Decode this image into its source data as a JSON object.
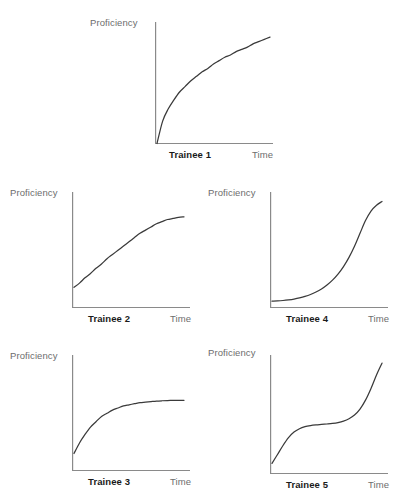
{
  "figure": {
    "background_color": "#ffffff",
    "axis_color": "#8a8a8a",
    "curve_color": "#3a3a3a",
    "label_color": "#6d6d6d",
    "trainee_label_color": "#1a1a1a"
  },
  "chart_data": [
    {
      "type": "line",
      "title": "Trainee 1",
      "xlabel": "Time",
      "ylabel": "Proficiency",
      "grid": false,
      "legend": "none",
      "xlim": [
        0,
        1
      ],
      "ylim": [
        0,
        1
      ],
      "shape": "negatively accelerated / decelerating learning curve",
      "x": [
        0.0,
        0.05,
        0.1,
        0.15,
        0.2,
        0.25,
        0.3,
        0.35,
        0.4,
        0.45,
        0.5,
        0.55,
        0.6,
        0.65,
        0.7,
        0.75,
        0.8,
        0.85,
        0.9,
        0.95,
        1.0
      ],
      "y": [
        0.0,
        0.2,
        0.31,
        0.39,
        0.46,
        0.51,
        0.56,
        0.6,
        0.64,
        0.67,
        0.71,
        0.74,
        0.77,
        0.79,
        0.82,
        0.84,
        0.86,
        0.89,
        0.91,
        0.93,
        0.95
      ]
    },
    {
      "type": "line",
      "title": "Trainee 2",
      "xlabel": "Time",
      "ylabel": "Proficiency",
      "grid": false,
      "legend": "none",
      "xlim": [
        0,
        1
      ],
      "ylim": [
        0,
        1
      ],
      "shape": "gradual rise, slightly decelerating near the end",
      "x": [
        0.0,
        0.05,
        0.1,
        0.15,
        0.2,
        0.25,
        0.3,
        0.35,
        0.4,
        0.45,
        0.5,
        0.55,
        0.6,
        0.65,
        0.7,
        0.75,
        0.8,
        0.85,
        0.9,
        0.95,
        1.0
      ],
      "y": [
        0.19,
        0.23,
        0.28,
        0.32,
        0.37,
        0.41,
        0.46,
        0.5,
        0.54,
        0.58,
        0.62,
        0.66,
        0.7,
        0.73,
        0.76,
        0.79,
        0.81,
        0.83,
        0.84,
        0.85,
        0.855
      ]
    },
    {
      "type": "line",
      "title": "Trainee 3",
      "xlabel": "Time",
      "ylabel": "Proficiency",
      "grid": false,
      "legend": "none",
      "xlim": [
        0,
        1
      ],
      "ylim": [
        0,
        1
      ],
      "shape": "rapid early gain then plateau / asymptote",
      "x": [
        0.0,
        0.05,
        0.1,
        0.15,
        0.2,
        0.25,
        0.3,
        0.35,
        0.4,
        0.45,
        0.5,
        0.55,
        0.6,
        0.65,
        0.7,
        0.75,
        0.8,
        0.85,
        0.9,
        0.95,
        1.0
      ],
      "y": [
        0.16,
        0.26,
        0.34,
        0.41,
        0.46,
        0.51,
        0.54,
        0.57,
        0.59,
        0.61,
        0.62,
        0.63,
        0.64,
        0.645,
        0.65,
        0.655,
        0.658,
        0.66,
        0.661,
        0.662,
        0.662
      ]
    },
    {
      "type": "line",
      "title": "Trainee 4",
      "xlabel": "Time",
      "ylabel": "Proficiency",
      "grid": false,
      "legend": "none",
      "xlim": [
        0,
        1
      ],
      "ylim": [
        0,
        1
      ],
      "shape": "positively accelerated / exponential learning curve",
      "x": [
        0.0,
        0.05,
        0.1,
        0.15,
        0.2,
        0.25,
        0.3,
        0.35,
        0.4,
        0.45,
        0.5,
        0.55,
        0.6,
        0.65,
        0.7,
        0.75,
        0.8,
        0.85,
        0.9,
        0.95,
        1.0
      ],
      "y": [
        0.06,
        0.062,
        0.066,
        0.072,
        0.08,
        0.091,
        0.105,
        0.123,
        0.146,
        0.175,
        0.212,
        0.258,
        0.315,
        0.386,
        0.473,
        0.578,
        0.7,
        0.82,
        0.91,
        0.965,
        1.0
      ]
    },
    {
      "type": "line",
      "title": "Trainee 5",
      "xlabel": "Time",
      "ylabel": "Proficiency",
      "grid": false,
      "legend": "none",
      "xlim": [
        0,
        1
      ],
      "ylim": [
        0,
        1
      ],
      "shape": "S-shaped: early gain, long plateau, then sharp late rise",
      "x": [
        0.0,
        0.05,
        0.1,
        0.15,
        0.2,
        0.25,
        0.3,
        0.35,
        0.4,
        0.45,
        0.5,
        0.55,
        0.6,
        0.65,
        0.7,
        0.75,
        0.8,
        0.85,
        0.9,
        0.95,
        1.0
      ],
      "y": [
        0.09,
        0.17,
        0.25,
        0.32,
        0.37,
        0.4,
        0.418,
        0.428,
        0.434,
        0.438,
        0.442,
        0.447,
        0.455,
        0.468,
        0.489,
        0.522,
        0.575,
        0.655,
        0.76,
        0.88,
        0.985
      ]
    }
  ],
  "panels": [
    {
      "id": "trainee-1",
      "trainee_label": "Trainee 1",
      "y_axis_label": "Proficiency",
      "x_axis_label": "Time"
    },
    {
      "id": "trainee-2",
      "trainee_label": "Trainee 2",
      "y_axis_label": "Proficiency",
      "x_axis_label": "Time"
    },
    {
      "id": "trainee-4",
      "trainee_label": "Trainee 4",
      "y_axis_label": "Proficiency",
      "x_axis_label": "Time"
    },
    {
      "id": "trainee-3",
      "trainee_label": "Trainee 3",
      "y_axis_label": "Proficiency",
      "x_axis_label": "Time"
    },
    {
      "id": "trainee-5",
      "trainee_label": "Trainee 5",
      "y_axis_label": "Proficiency",
      "x_axis_label": "Time"
    }
  ]
}
